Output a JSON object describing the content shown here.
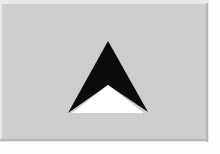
{
  "image": {
    "width": 220,
    "height": 154,
    "description": "Black upward-pointing arrowhead with white triangular notch on a light gray plate",
    "alt_text": "up arrow glyph"
  },
  "plate": {
    "background_color": "#cfcfcf",
    "outer_color": "#e9e9e9",
    "page_color": "#fdfdfd",
    "edge_color": "#b5b5b5",
    "left": 2,
    "top": 4,
    "width": 205,
    "height": 136
  },
  "arrow": {
    "name": "up-arrow-glyph",
    "fill_color": "#0b0b0b",
    "notch_color": "#ffffff",
    "tip": {
      "x": 108,
      "y": 41
    },
    "left_corner": {
      "x": 68,
      "y": 113
    },
    "right_corner": {
      "x": 148,
      "y": 112
    },
    "notch_apex": {
      "x": 108,
      "y": 85
    },
    "notch_left": {
      "x": 72,
      "y": 113
    },
    "notch_right": {
      "x": 144,
      "y": 113
    },
    "outer_points": "108,41 148,112 108,85 68,113",
    "notch_points": "108,85 144,113 72,113"
  }
}
